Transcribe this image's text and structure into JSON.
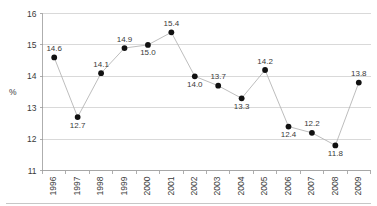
{
  "chart_data": {
    "type": "line",
    "title": "",
    "subtitle": "",
    "xlabel": "",
    "ylabel": "%",
    "categories": [
      "1996",
      "1997",
      "1998",
      "1999",
      "2000",
      "2001",
      "2002",
      "2003",
      "2004",
      "2005",
      "2006",
      "2007",
      "2008",
      "2009"
    ],
    "values": [
      14.6,
      12.7,
      14.1,
      14.9,
      15.0,
      15.4,
      14.0,
      13.7,
      13.3,
      14.2,
      12.4,
      12.2,
      11.8,
      13.8
    ],
    "point_labels": [
      "14.6",
      "12.7",
      "14.1",
      "14.9",
      "15.0",
      "15.4",
      "14.0",
      "13.7",
      "13.3",
      "14.2",
      "12.4",
      "12.2",
      "11.8",
      "13.8"
    ],
    "label_placement": [
      "above",
      "below",
      "above",
      "above",
      "below",
      "above",
      "below",
      "above",
      "below",
      "above",
      "below",
      "above",
      "below",
      "above"
    ],
    "ylim": [
      11,
      16
    ],
    "yticks": [
      11,
      12,
      13,
      14,
      15,
      16
    ],
    "ytick_labels": [
      "11",
      "12",
      "13",
      "14",
      "15",
      "16"
    ],
    "grid": true,
    "legend": "none",
    "xtick_rotation": 90,
    "marker": "filled-circle",
    "colors": {
      "marker": "#111111",
      "line": "#b5b5b5",
      "grid": "#c9c9c9",
      "axis": "#9a9a9a",
      "text": "#3a3a3a",
      "background": "#ffffff"
    }
  }
}
